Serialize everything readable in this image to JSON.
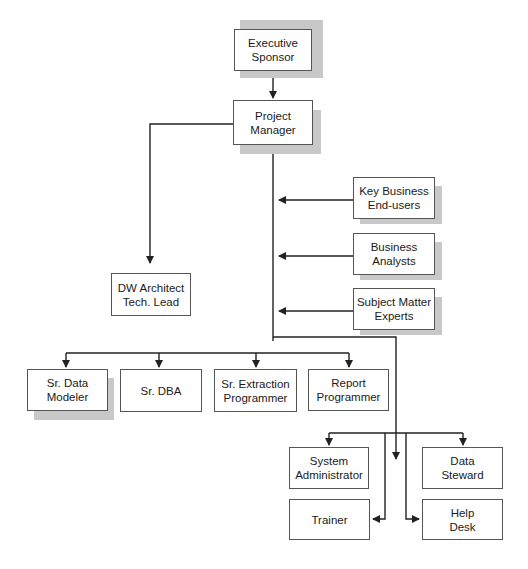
{
  "diagram": {
    "title": "",
    "nodes": {
      "executive_sponsor": "Executive\nSponsor",
      "project_manager": "Project Manager",
      "key_business_end_users": "Key Business\nEnd-users",
      "business_analysts": "Business\nAnalysts",
      "subject_matter_experts": "Subject Matter\nExperts",
      "dw_architect": "DW Architect\nTech. Lead",
      "sr_data_modeler": "Sr. Data Modeler",
      "sr_dba": "Sr. DBA",
      "sr_extraction_programmer": "Sr. Extraction\nProgrammer",
      "report_programmer": "Report\nProgrammer",
      "system_administrator": "System\nAdministrator",
      "data_steward": "Data\nSteward",
      "trainer": "Trainer",
      "help_desk": "Help\nDesk"
    },
    "edges": [
      {
        "from": "Executive Sponsor",
        "to": "Project Manager"
      },
      {
        "from": "Project Manager",
        "to": "DW Architect Tech. Lead"
      },
      {
        "from": "Key Business End-users",
        "to": "Project Manager line"
      },
      {
        "from": "Business Analysts",
        "to": "Project Manager line"
      },
      {
        "from": "Subject Matter Experts",
        "to": "Project Manager line"
      },
      {
        "from": "Project Manager",
        "to": "Sr. Data Modeler"
      },
      {
        "from": "Project Manager",
        "to": "Sr. DBA"
      },
      {
        "from": "Project Manager",
        "to": "Sr. Extraction Programmer"
      },
      {
        "from": "Project Manager",
        "to": "Report Programmer"
      },
      {
        "from": "Project Manager",
        "to": "System Administrator"
      },
      {
        "from": "Project Manager",
        "to": "Data Steward"
      },
      {
        "from": "Project Manager",
        "to": "Trainer"
      },
      {
        "from": "Project Manager",
        "to": "Help Desk"
      }
    ]
  }
}
